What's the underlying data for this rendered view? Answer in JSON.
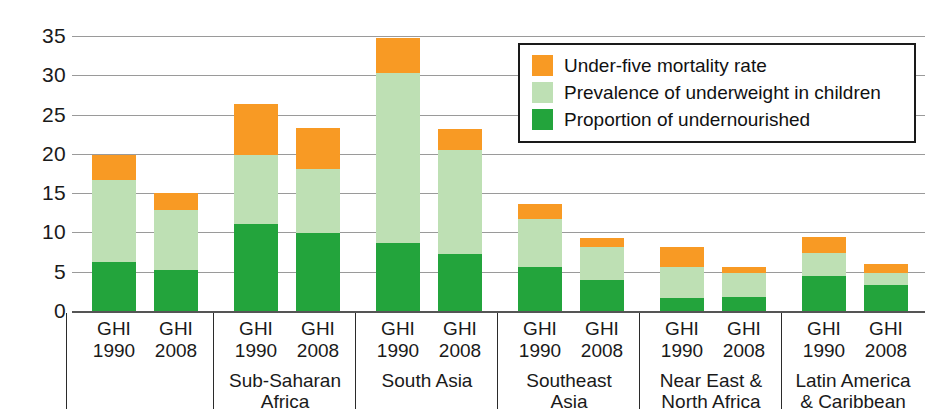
{
  "chart_data": {
    "type": "bar",
    "stacked": true,
    "title": "",
    "xlabel": "",
    "ylabel": "",
    "ylim": [
      0,
      35
    ],
    "ytick_step": 5,
    "yticks": [
      "35",
      "30",
      "25",
      "20",
      "15",
      "10",
      "5",
      "0"
    ],
    "grid": true,
    "legend_position": "top-right-inside",
    "categories": [
      "World GHI 1990",
      "World GHI 2008",
      "Sub-Saharan Africa GHI 1990",
      "Sub-Saharan Africa GHI 2008",
      "South Asia GHI 1990",
      "South Asia GHI 2008",
      "Southeast Asia GHI 1990",
      "Southeast Asia GHI 2008",
      "Near East & North Africa GHI 1990",
      "Near East & North Africa GHI 2008",
      "Latin America & Caribbean GHI 1990",
      "Latin America & Caribbean GHI 2008"
    ],
    "series": [
      {
        "name": "Proportion of undernourished",
        "color": "#23A43C",
        "values": [
          6.2,
          5.2,
          11.1,
          9.9,
          8.7,
          7.3,
          5.6,
          4.0,
          1.6,
          1.8,
          4.5,
          3.3
        ]
      },
      {
        "name": "Prevalence of underweight in children",
        "color": "#BEE0B4",
        "values": [
          10.5,
          7.6,
          8.8,
          8.2,
          21.6,
          13.2,
          6.1,
          4.2,
          4.0,
          3.0,
          2.9,
          1.5
        ]
      },
      {
        "name": "Under-five mortality rate",
        "color": "#F89A24",
        "values": [
          3.1,
          2.2,
          6.4,
          5.2,
          4.5,
          2.7,
          1.9,
          1.1,
          2.5,
          0.8,
          2.0,
          1.2
        ]
      }
    ],
    "totals": [
      19.8,
      15.0,
      26.3,
      23.3,
      34.8,
      23.2,
      13.6,
      9.3,
      8.1,
      5.6,
      9.4,
      6.0
    ]
  },
  "axis": {
    "yticks": [
      {
        "label": "35",
        "value": 35
      },
      {
        "label": "30",
        "value": 30
      },
      {
        "label": "25",
        "value": 25
      },
      {
        "label": "20",
        "value": 20
      },
      {
        "label": "15",
        "value": 15
      },
      {
        "label": "10",
        "value": 10
      },
      {
        "label": "5",
        "value": 5
      },
      {
        "label": "0",
        "value": 0
      }
    ]
  },
  "legend": {
    "items": [
      {
        "label": "Under-five mortality rate",
        "color": "#F89A24"
      },
      {
        "label": "Prevalence of underweight in children",
        "color": "#BEE0B4"
      },
      {
        "label": "Proportion of undernourished",
        "color": "#23A43C"
      }
    ]
  },
  "groups": [
    {
      "name": "World",
      "bars": [
        {
          "ghi": "GHI",
          "year": "1990",
          "undernourished": 6.2,
          "underweight": 10.5,
          "under5": 3.1,
          "total": 19.8
        },
        {
          "ghi": "GHI",
          "year": "2008",
          "undernourished": 5.2,
          "underweight": 7.6,
          "under5": 2.2,
          "total": 15.0
        }
      ]
    },
    {
      "name": "Sub-Saharan\nAfrica",
      "name_line1": "Sub-Saharan",
      "name_line2": "Africa",
      "bars": [
        {
          "ghi": "GHI",
          "year": "1990",
          "undernourished": 11.1,
          "underweight": 8.8,
          "under5": 6.4,
          "total": 26.3
        },
        {
          "ghi": "GHI",
          "year": "2008",
          "undernourished": 9.9,
          "underweight": 8.2,
          "under5": 5.2,
          "total": 23.3
        }
      ]
    },
    {
      "name": "South Asia",
      "name_line1": "South Asia",
      "name_line2": "",
      "bars": [
        {
          "ghi": "GHI",
          "year": "1990",
          "undernourished": 8.7,
          "underweight": 21.6,
          "under5": 4.5,
          "total": 34.8
        },
        {
          "ghi": "GHI",
          "year": "2008",
          "undernourished": 7.3,
          "underweight": 13.2,
          "under5": 2.7,
          "total": 23.2
        }
      ]
    },
    {
      "name": "Southeast Asia",
      "name_line1": "Southeast",
      "name_line2": "Asia",
      "bars": [
        {
          "ghi": "GHI",
          "year": "1990",
          "undernourished": 5.6,
          "underweight": 6.1,
          "under5": 1.9,
          "total": 13.6
        },
        {
          "ghi": "GHI",
          "year": "2008",
          "undernourished": 4.0,
          "underweight": 4.2,
          "under5": 1.1,
          "total": 9.3
        }
      ]
    },
    {
      "name": "Near East & North Africa",
      "name_line1": "Near East &",
      "name_line2": "North Africa",
      "bars": [
        {
          "ghi": "GHI",
          "year": "1990",
          "undernourished": 1.6,
          "underweight": 4.0,
          "under5": 2.5,
          "total": 8.1
        },
        {
          "ghi": "GHI",
          "year": "2008",
          "undernourished": 1.8,
          "underweight": 3.0,
          "under5": 0.8,
          "total": 5.6
        }
      ]
    },
    {
      "name": "Latin America & Caribbean",
      "name_line1": "Latin America",
      "name_line2": "& Caribbean",
      "bars": [
        {
          "ghi": "GHI",
          "year": "1990",
          "undernourished": 4.5,
          "underweight": 2.9,
          "under5": 2.0,
          "total": 9.4
        },
        {
          "ghi": "GHI",
          "year": "2008",
          "undernourished": 3.3,
          "underweight": 1.5,
          "under5": 1.2,
          "total": 6.0
        }
      ]
    }
  ]
}
